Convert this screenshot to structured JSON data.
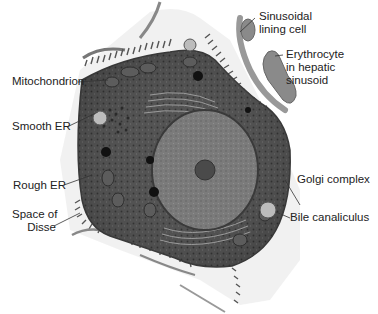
{
  "figure": {
    "labels": {
      "sinusoidal_lining_cell": "Sinusoidal\nlining cell",
      "erythrocyte": "Erythrocyte\nin hepatic\nsinusoid",
      "mitochondrion": "Mitochondrion",
      "smooth_er": "Smooth ER",
      "rough_er": "Rough ER",
      "space_of_disse": "Space of\nDisse",
      "golgi_complex": "Golgi complex",
      "bile_canaliculus": "Bile canaliculus"
    },
    "colors": {
      "cytoplasm": "#4a4a4a",
      "nucleus": "#7a7a7a",
      "nucleolus": "#3a3a3a",
      "erythrocyte": "#8a8a8a",
      "membrane": "#d8d8d8",
      "leader_line": "#333333"
    }
  }
}
